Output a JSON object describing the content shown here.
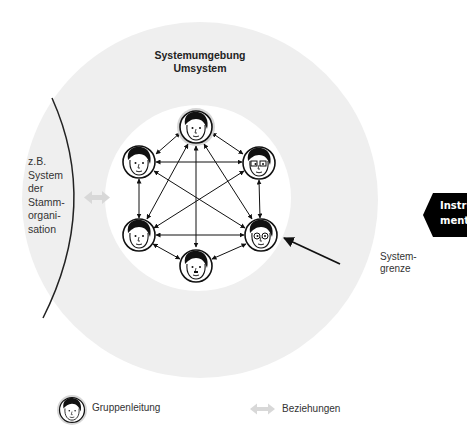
{
  "diagram": {
    "title_line1": "Systemumgebung",
    "title_line2": "Umsystem",
    "parent_system_label": [
      "z.B.",
      "System",
      "der",
      "Stamm-",
      "organi-",
      "sation"
    ],
    "boundary_label_line1": "System-",
    "boundary_label_line2": "grenze",
    "side_tab_line1": "Instru-",
    "side_tab_line2": "mente",
    "members": [
      {
        "id": "leader",
        "role": "Gruppenleitung",
        "x": 196,
        "y": 127
      },
      {
        "id": "upper-left",
        "x": 139,
        "y": 162
      },
      {
        "id": "upper-right",
        "x": 259,
        "y": 163
      },
      {
        "id": "lower-left",
        "x": 139,
        "y": 235
      },
      {
        "id": "lower-right",
        "x": 261,
        "y": 235
      },
      {
        "id": "bottom",
        "x": 196,
        "y": 266
      }
    ],
    "relations": "all-to-all double-headed arrows between 6 members",
    "colors": {
      "environment": "#efefef",
      "group_area": "#ffffff",
      "leader_halo": "#d6d6d6",
      "relation_arrow_legend": "#d8d8d8",
      "side_tab": "#000000"
    }
  },
  "legend": {
    "leader_label": "Gruppenleitung",
    "relations_label": "Beziehungen"
  }
}
